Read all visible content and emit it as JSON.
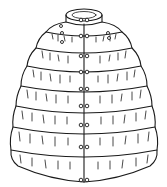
{
  "image": {
    "subject": "Line drawing of a tiered quilted cape with stand collar, center-front opening and paired buttons",
    "caption_fragment": "",
    "tiers": 8,
    "button_pairs": 8,
    "colors": {
      "line": "#1a1a1a",
      "background": "#ffffff"
    }
  }
}
